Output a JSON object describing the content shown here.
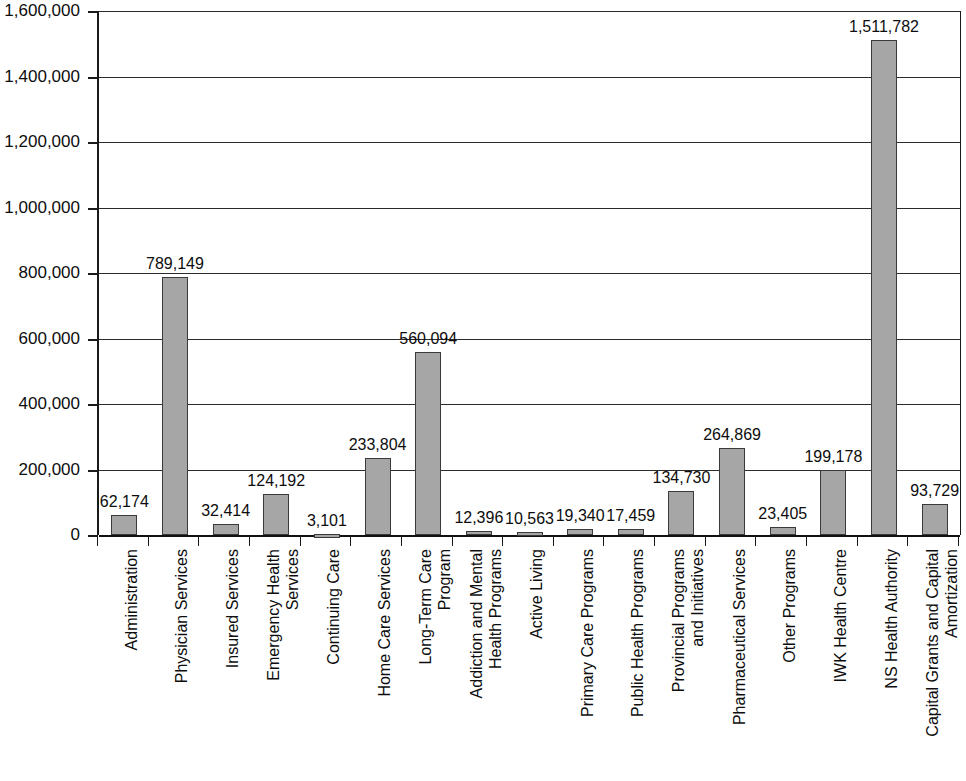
{
  "chart_data": {
    "type": "bar",
    "title": "",
    "subtitle": "",
    "xlabel": "",
    "ylabel": "",
    "ylim": [
      0,
      1600000
    ],
    "ytick_step": 200000,
    "grid": true,
    "legend": false,
    "orientation": "vertical",
    "bar_color": "#a6a6a6",
    "bar_border_color": "#3a3a3a",
    "axis_color": "#1a1a1a",
    "value_labels_shown": true,
    "ytick_labels": [
      "1,600,000",
      "1,400,000",
      "1,200,000",
      "1,000,000",
      "800,000",
      "600,000",
      "400,000",
      "200,000",
      "0"
    ],
    "ytick_values": [
      1600000,
      1400000,
      1200000,
      1000000,
      800000,
      600000,
      400000,
      200000,
      0
    ],
    "categories": [
      "Administration",
      "Physician Services",
      "Insured Services",
      "Emergency Health Services",
      "Continuing Care",
      "Home Care Services",
      "Long-Term Care Program",
      "Addiction and Mental Health Programs",
      "Active Living",
      "Primary Care Programs",
      "Public Health Programs",
      "Provincial Programs and Initiatives",
      "Pharmaceutical Services",
      "Other Programs",
      "IWK Health Centre",
      "NS Health Authority",
      "Capital Grants and Capital Amortization"
    ],
    "category_lines": [
      [
        "Administration"
      ],
      [
        "Physician Services"
      ],
      [
        "Insured Services"
      ],
      [
        "Emergency Health",
        "Services"
      ],
      [
        "Continuing Care"
      ],
      [
        "Home Care Services"
      ],
      [
        "Long-Term Care",
        "Program"
      ],
      [
        "Addiction and Mental",
        "Health Programs"
      ],
      [
        "Active Living"
      ],
      [
        "Primary Care Programs"
      ],
      [
        "Public Health Programs"
      ],
      [
        "Provincial Programs",
        "and Initiatives"
      ],
      [
        "Pharmaceutical Services"
      ],
      [
        "Other Programs"
      ],
      [
        "IWK Health Centre"
      ],
      [
        "NS Health Authority"
      ],
      [
        "Capital Grants and Capital",
        "Amortization"
      ]
    ],
    "values": [
      62174,
      789149,
      32414,
      124192,
      3101,
      233804,
      560094,
      12396,
      10563,
      19340,
      17459,
      134730,
      264869,
      23405,
      199178,
      1511782,
      93729
    ],
    "value_labels": [
      "62,174",
      "789,149",
      "32,414",
      "124,192",
      "3,101",
      "233,804",
      "560,094",
      "12,396",
      "10,563",
      "19,340",
      "17,459",
      "134,730",
      "264,869",
      "23,405",
      "199,178",
      "1,511,782",
      "93,729"
    ]
  }
}
